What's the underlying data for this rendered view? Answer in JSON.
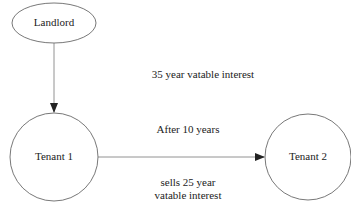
{
  "diagram": {
    "nodes": {
      "landlord": {
        "label": "Landlord"
      },
      "tenant1": {
        "label": "Tenant 1"
      },
      "tenant2": {
        "label": "Tenant 2"
      }
    },
    "edges": {
      "landlord_to_tenant1": {
        "label": "35 year vatable interest"
      },
      "tenant1_to_tenant2": {
        "label_top": "After 10 years",
        "label_bottom_line1": "sells 25 year",
        "label_bottom_line2": "vatable interest"
      }
    },
    "colors": {
      "stroke": "#555555",
      "text": "#222222",
      "arrowhead": "#222222"
    }
  }
}
